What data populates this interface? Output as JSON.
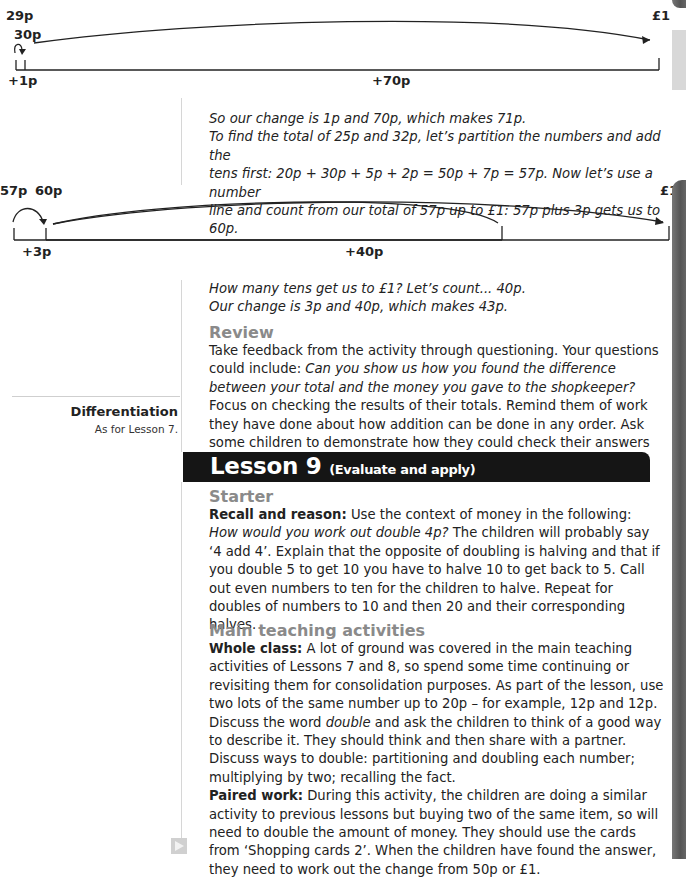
{
  "number_line_1": {
    "start_label": "29p",
    "mid_label": "30p",
    "end_label": "£1",
    "jump_small": "+1p",
    "jump_large": "+70p"
  },
  "explanation_1": {
    "line1": "So our change is 1p and 70p, which makes 71p.",
    "line2": "To find the total of 25p and 32p, let’s partition the numbers and add the",
    "line3": "tens first: 20p + 30p + 5p + 2p = 50p + 7p = 57p. Now let’s use a number",
    "line4": "line and count from our total of 57p up to £1: 57p plus 3p gets us to 60p."
  },
  "number_line_2": {
    "start_label": "57p",
    "mid_label": "60p",
    "end_label": "£1",
    "jump_small": "+3p",
    "jump_large": "+40p"
  },
  "explanation_2": {
    "line1": "How many tens get us to £1? Let’s count... 40p.",
    "line2": "Our change is 3p and 40p, which makes 43p."
  },
  "review": {
    "heading": "Review",
    "text_a": "Take feedback from the activity through questioning. Your questions could include: ",
    "text_question": "Can you show us how you found the difference between your total and the money you gave to the shopkeeper?",
    "text_b": " Focus on checking the results of their totals. Remind them of work they have done about how addition can be done in any order. Ask some children to demonstrate how they could check their answers (by adding the amounts in a different order)."
  },
  "differentiation": {
    "label": "Differentiation",
    "text": "As for Lesson 7."
  },
  "lesson": {
    "title": "Lesson 9",
    "subtitle": "(Evaluate and apply)"
  },
  "starter": {
    "heading": "Starter",
    "lead": "Recall and reason:",
    "text_a": " Use the context of money in the following: ",
    "text_question": "How would you work out double 4p?",
    "text_b": " The children will probably say ‘4 add 4’. Explain that the opposite of doubling is halving and that if you double 5 to get 10 you have to halve 10  to get back to 5. Call out even numbers to ten for the children to halve. Repeat for doubles of numbers to 10 and then 20 and their corresponding halves."
  },
  "main_teaching": {
    "heading": "Main teaching activities",
    "whole_class_lead": "Whole class:",
    "whole_class_a": " A lot of ground was covered in the main teaching activities of Lessons 7 and 8, so spend some time continuing or revisiting them for consolidation purposes. As part of the lesson, use two lots of the same number up to 20p – for example, 12p and 12p. Discuss the word ",
    "whole_class_word": "double",
    "whole_class_b": " and ask the children to think of a good way to describe it. They should think and then share with a partner. Discuss ways to double: partitioning and doubling each number; multiplying by two; recalling the fact.",
    "paired_lead": "Paired work:",
    "paired_text": " During this activity, the children are doing a similar activity to previous lessons but buying two of the same item, so will need to double the amount of money. They should use the cards from ‘Shopping cards 2’. When the children have found the answer, they need to work out the change from 50p or £1."
  }
}
